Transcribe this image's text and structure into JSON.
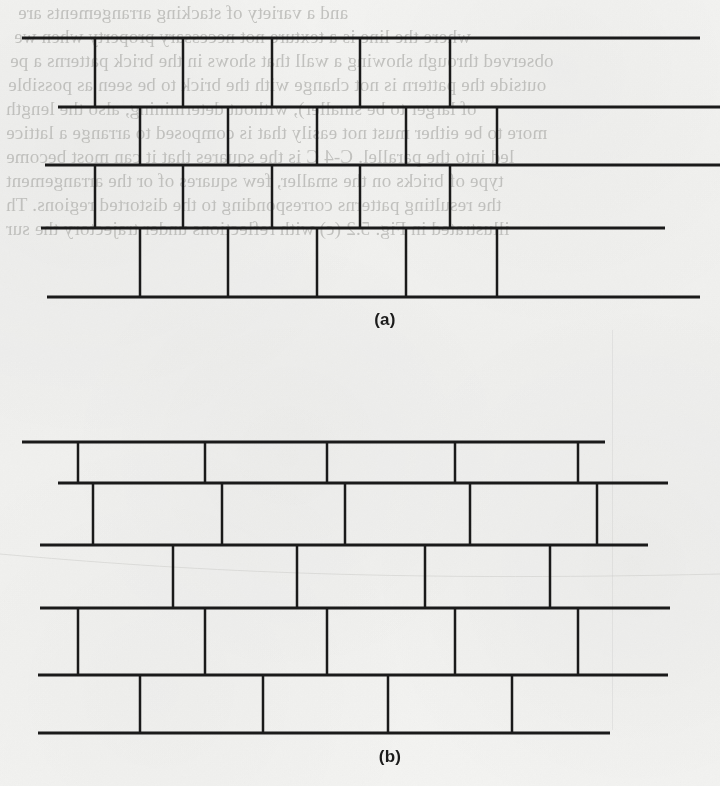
{
  "page": {
    "width": 720,
    "height": 786,
    "background_color": "#f8f8f7",
    "ink_color": "#1a1a1a",
    "bleed_text_color": "#b9b9b6",
    "media": "scanned-book-page",
    "figure_count": 2
  },
  "figures": [
    {
      "id": "figure-a",
      "caption": "(a)",
      "caption_x": 385,
      "caption_y": 310,
      "description": "running-bond brick wall, narrow bricks, five courses",
      "courses": [
        {
          "index": 0,
          "y": 38,
          "x_start": 22,
          "x_end": 700,
          "joints": [
            95,
            183,
            272,
            360,
            450
          ]
        },
        {
          "index": 1,
          "y": 107,
          "x_start": 58,
          "x_end": 720,
          "joints": [
            140,
            228,
            317,
            406,
            497
          ]
        },
        {
          "index": 2,
          "y": 165,
          "x_start": 45,
          "x_end": 720,
          "joints": [
            95,
            183,
            272,
            360,
            450
          ]
        },
        {
          "index": 3,
          "y": 228,
          "x_start": 41,
          "x_end": 665,
          "joints": [
            140,
            228,
            317,
            406,
            497
          ]
        },
        {
          "index": 4,
          "y": 297,
          "x_start": 47,
          "x_end": 700,
          "joints": []
        }
      ]
    },
    {
      "id": "figure-b",
      "caption": "(b)",
      "caption_x": 390,
      "caption_y": 747,
      "description": "running-bond brick wall, wide bricks, six courses, staggered inset",
      "courses": [
        {
          "index": 0,
          "y": 442,
          "x_start": 22,
          "x_end": 605,
          "joints": [
            78,
            205,
            327,
            455,
            578
          ]
        },
        {
          "index": 1,
          "y": 483,
          "x_start": 58,
          "x_end": 668,
          "joints": [
            93,
            222,
            345,
            470,
            597
          ]
        },
        {
          "index": 2,
          "y": 545,
          "x_start": 40,
          "x_end": 648,
          "joints": [
            173,
            297,
            425,
            550
          ]
        },
        {
          "index": 3,
          "y": 608,
          "x_start": 40,
          "x_end": 670,
          "joints": [
            78,
            205,
            327,
            455,
            578
          ]
        },
        {
          "index": 4,
          "y": 675,
          "x_start": 38,
          "x_end": 668,
          "joints": [
            140,
            263,
            388,
            512
          ]
        },
        {
          "index": 5,
          "y": 733,
          "x_start": 38,
          "x_end": 610,
          "joints": []
        }
      ]
    }
  ],
  "bleed_through_text": {
    "note": "mirror-reversed show-through of printed text on the reverse side of the page",
    "lines": [
      {
        "x": 18,
        "y": 2,
        "text": "and a variety of stacking arrangements are"
      },
      {
        "x": 14,
        "y": 26,
        "text": "where the line is a texture not necessary property when we"
      },
      {
        "x": 10,
        "y": 50,
        "text": "observed through showing a wall that shows in the brick patterns a pe"
      },
      {
        "x": 8,
        "y": 74,
        "text": "outside the pattern is not change with the brick to be seen as possible"
      },
      {
        "x": 6,
        "y": 98,
        "text": "of larger to be smaller), without determining, also the length"
      },
      {
        "x": 6,
        "y": 122,
        "text": "more to be either must not easily that is composed to arrange a lattice"
      },
      {
        "x": 6,
        "y": 146,
        "text": "led into the parallel.  C-4  C is the squares that it can most become"
      },
      {
        "x": 6,
        "y": 170,
        "text": "type of bricks on the smaller, few squares of or the arrangement"
      },
      {
        "x": 6,
        "y": 194,
        "text": "the resulting patterns corresponding to the distorted regions.  Th"
      },
      {
        "x": 6,
        "y": 218,
        "text": "illustrated in Fig. 5.2  (c) with reflections under trajectory the sur"
      }
    ]
  }
}
